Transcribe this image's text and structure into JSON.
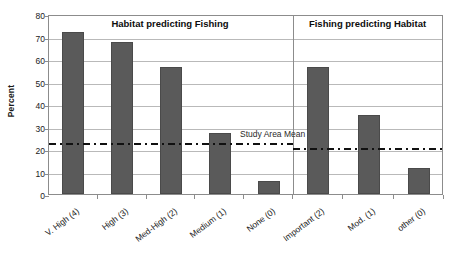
{
  "chart_data": {
    "type": "bar",
    "title": "",
    "xlabel": "",
    "ylabel": "Percent",
    "ylim": [
      0,
      80
    ],
    "ytick_labels": [
      "0",
      "10",
      "20",
      "30",
      "40",
      "50",
      "60",
      "70",
      "80"
    ],
    "ytick_values": [
      0,
      10,
      20,
      30,
      40,
      50,
      60,
      70,
      80
    ],
    "grid": true,
    "legend": "none",
    "panels": [
      {
        "title": "Habitat predicting Fishing",
        "categories": [
          "V. High (4)",
          "High (3)",
          "Med-High (2)",
          "Medium (1)",
          "None (0)"
        ],
        "values": [
          72,
          67.5,
          56.5,
          27,
          6
        ],
        "reference_line": {
          "label": "Study Area Mean",
          "value": 23.7
        }
      },
      {
        "title": "Fishing predicting Habitat",
        "categories": [
          "Important (2)",
          "Mod. (1)",
          "other (0)"
        ],
        "values": [
          56.5,
          35,
          11.5
        ],
        "reference_line": {
          "label": "",
          "value": 21.5
        }
      }
    ],
    "annotations": [
      {
        "text": "Study Area Mean",
        "value": 23.7
      }
    ],
    "colors": {
      "bar_fill": "#5a5a5a",
      "bar_edge": "#4a4a4a",
      "gridline": "#b9b9b9",
      "axis": "#8c8c8c",
      "reference_line": "#111111",
      "background": "#ffffff"
    }
  }
}
